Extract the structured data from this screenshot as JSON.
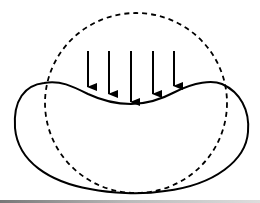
{
  "diagram": {
    "stroke_color": "#000000",
    "background": "#ffffff",
    "original_shape": {
      "type": "circle",
      "style": "dashed",
      "cx": 136,
      "cy": 103,
      "rx": 91,
      "ry": 90
    },
    "deformed_shape": {
      "type": "closed-curve",
      "style": "solid"
    },
    "load_arrows": {
      "count": 5,
      "direction": "down",
      "x_positions": [
        88,
        109,
        131,
        153,
        174
      ],
      "top_y": 51,
      "tip_y": [
        87,
        94,
        102,
        94,
        86
      ]
    }
  }
}
